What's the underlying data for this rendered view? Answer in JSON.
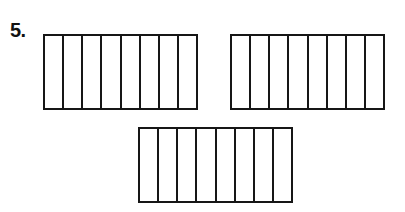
{
  "problem": {
    "number_label": "5.",
    "bars": [
      {
        "name": "fraction-bar-1",
        "parts": 8,
        "shaded": 0,
        "box": {
          "left": 43,
          "top": 34,
          "width": 155,
          "height": 76
        }
      },
      {
        "name": "fraction-bar-2",
        "parts": 8,
        "shaded": 0,
        "box": {
          "left": 230,
          "top": 34,
          "width": 155,
          "height": 76
        }
      },
      {
        "name": "fraction-bar-3",
        "parts": 8,
        "shaded": 0,
        "box": {
          "left": 138,
          "top": 127,
          "width": 155,
          "height": 76
        }
      }
    ]
  },
  "colors": {
    "line": "#161616",
    "background": "#ffffff"
  }
}
